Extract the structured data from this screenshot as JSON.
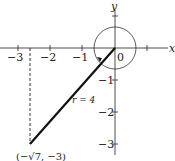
{
  "diagram": {
    "axes": {
      "x_label": "x",
      "y_label": "y",
      "origin_label": "0",
      "x_ticks": [
        "−3",
        "−2",
        "−1"
      ],
      "y_ticks": [
        "−1",
        "−2",
        "−3"
      ]
    },
    "segment": {
      "label": "r = 4",
      "point_label": "(−√7, −3)"
    },
    "colors": {
      "ink": "#222222",
      "background": "#ffffff"
    }
  }
}
